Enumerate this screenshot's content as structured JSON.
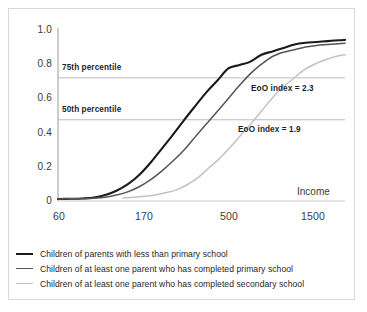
{
  "chart_data": {
    "type": "line",
    "title": "",
    "xlabel": "Income",
    "ylabel": "Fraction",
    "xscale": "log",
    "xlim": [
      60,
      1800
    ],
    "ylim": [
      0,
      1.0
    ],
    "grid": false,
    "xticks": [
      "60",
      "170",
      "500",
      "1500"
    ],
    "xtick_values": [
      60,
      170,
      500,
      1500
    ],
    "yticks": [
      "0",
      "0.2",
      "0.4",
      "0.6",
      "0.8",
      "1.0"
    ],
    "ytick_values": [
      0,
      0.2,
      0.4,
      0.6,
      0.8,
      1.0
    ],
    "reference_lines": [
      {
        "label": "75th percentile",
        "y": 0.72
      },
      {
        "label": "50th percentile",
        "y": 0.475
      }
    ],
    "annotations": [
      {
        "label": "EoO index = 2.3",
        "x": 620,
        "y": 0.645
      },
      {
        "label": "EoO index = 1.9",
        "x": 560,
        "y": 0.41
      }
    ],
    "series": [
      {
        "name": "Children of parents with less than primary school",
        "color": "#1a1a1a",
        "width": 2.1,
        "x": [
          60,
          70,
          80,
          92,
          105,
          120,
          138,
          158,
          180,
          205,
          235,
          268,
          305,
          348,
          397,
          452,
          515,
          587,
          669,
          762,
          869,
          990,
          1128,
          1285,
          1465,
          1670,
          1800
        ],
        "values": [
          0.012,
          0.013,
          0.015,
          0.02,
          0.035,
          0.06,
          0.1,
          0.155,
          0.225,
          0.305,
          0.39,
          0.475,
          0.555,
          0.635,
          0.705,
          0.775,
          0.795,
          0.815,
          0.855,
          0.875,
          0.895,
          0.915,
          0.925,
          0.93,
          0.935,
          0.94,
          0.942
        ]
      },
      {
        "name": "Children of at least one parent who has completed primary school",
        "color": "#555555",
        "width": 1.5,
        "x": [
          60,
          70,
          80,
          92,
          105,
          120,
          138,
          158,
          180,
          205,
          235,
          268,
          305,
          348,
          397,
          452,
          515,
          587,
          669,
          762,
          869,
          990,
          1128,
          1285,
          1465,
          1670,
          1800
        ],
        "values": [
          0.012,
          0.013,
          0.014,
          0.016,
          0.022,
          0.035,
          0.055,
          0.085,
          0.125,
          0.175,
          0.235,
          0.3,
          0.375,
          0.45,
          0.525,
          0.6,
          0.675,
          0.745,
          0.8,
          0.845,
          0.87,
          0.885,
          0.9,
          0.91,
          0.915,
          0.92,
          0.922
        ]
      },
      {
        "name": "Children of at least one parent who has  completed secondary school",
        "color": "#c2c2c2",
        "width": 1.5,
        "x": [
          130,
          148,
          168,
          190,
          215,
          244,
          277,
          314,
          356,
          404,
          458,
          519,
          589,
          668,
          757,
          859,
          974,
          1104,
          1252,
          1420,
          1610,
          1800
        ],
        "values": [
          0.018,
          0.022,
          0.028,
          0.035,
          0.048,
          0.065,
          0.095,
          0.135,
          0.19,
          0.245,
          0.31,
          0.38,
          0.45,
          0.525,
          0.6,
          0.665,
          0.715,
          0.765,
          0.8,
          0.825,
          0.845,
          0.855
        ]
      }
    ]
  },
  "axes": {
    "ylabel": "Fraction",
    "xlabel": "Income",
    "yticks": [
      "1.0",
      "0.8",
      "0.6",
      "0.4",
      "0.2",
      "0"
    ],
    "xticks": [
      "60",
      "170",
      "500",
      "1500"
    ]
  },
  "reference_labels": {
    "p75": "75th percentile",
    "p50": "50th percentile"
  },
  "annotation_labels": {
    "eoo_high": "EoO index = 2.3",
    "eoo_low": "EoO index = 1.9"
  },
  "legend": {
    "items": [
      {
        "label": "Children of parents with less than primary school",
        "color": "#1a1a1a",
        "width": 2.4
      },
      {
        "label": "Children of at least one parent who has completed primary school",
        "color": "#555555",
        "width": 1.5
      },
      {
        "label": "Children of at least one parent who has  completed secondary school",
        "color": "#c2c2c2",
        "width": 1.4
      }
    ]
  }
}
